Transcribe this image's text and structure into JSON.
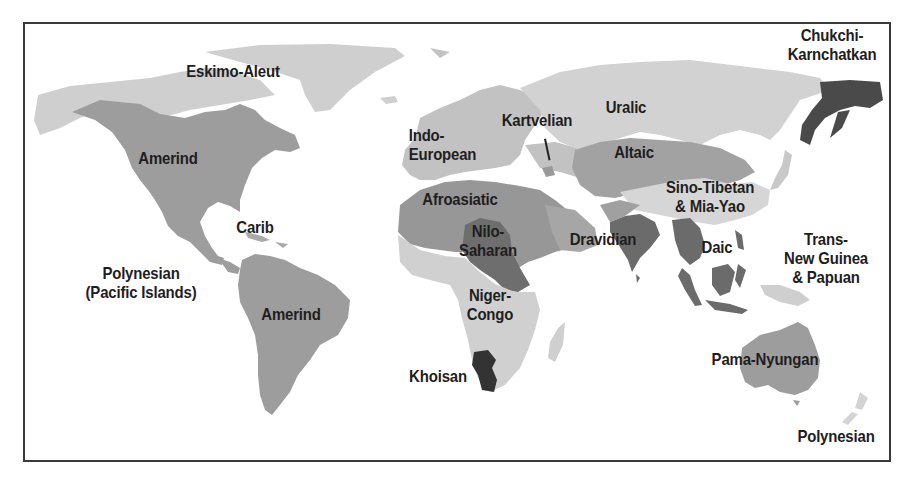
{
  "colors": {
    "very_light": "#d2d2d2",
    "light": "#bdbdbd",
    "medium": "#9d9d9d",
    "medium_dark": "#888888",
    "dark": "#6b6b6b",
    "darkest": "#333333",
    "ocean": "#ffffff",
    "border": "#3a3a3a",
    "label": "#1e1e1e"
  },
  "map": {
    "regions": [
      {
        "name": "Eskimo-Aleut",
        "label": "Eskimo-Aleut",
        "shade": "light"
      },
      {
        "name": "Chukchi-Karnchatkan",
        "label": "Chukchi-\nKarnchatkan",
        "shade": "darkest"
      },
      {
        "name": "Amerind (North America)",
        "label": "Amerind",
        "shade": "medium"
      },
      {
        "name": "Indo-European",
        "label": "Indo-\nEuropean",
        "shade": "light"
      },
      {
        "name": "Kartvelian",
        "label": "Kartvelian",
        "shade": "medium"
      },
      {
        "name": "Uralic",
        "label": "Uralic",
        "shade": "very_light"
      },
      {
        "name": "Altaic",
        "label": "Altaic",
        "shade": "medium"
      },
      {
        "name": "Afroasiatic",
        "label": "Afroasiatic",
        "shade": "medium"
      },
      {
        "name": "Nilo-Saharan",
        "label": "Nilo-\nSaharan",
        "shade": "dark"
      },
      {
        "name": "Dravidian",
        "label": "Dravidian",
        "shade": "dark"
      },
      {
        "name": "Sino-Tibetan & Mia-Yao",
        "label": "Sino-Tibetan\n& Mia-Yao",
        "shade": "very_light"
      },
      {
        "name": "Daic",
        "label": "Daic",
        "shade": "dark"
      },
      {
        "name": "Carib",
        "label": "Carib",
        "shade": "medium"
      },
      {
        "name": "Polynesian (Pacific Islands)",
        "label": "Polynesian\n(Pacific Islands)",
        "shade": "very_light"
      },
      {
        "name": "Amerind (South America)",
        "label": "Amerind",
        "shade": "medium"
      },
      {
        "name": "Niger-Congo",
        "label": "Niger-\nCongo",
        "shade": "very_light"
      },
      {
        "name": "Khoisan",
        "label": "Khoisan",
        "shade": "darkest"
      },
      {
        "name": "Trans-New Guinea & Papuan",
        "label": "Trans-\nNew Guinea\n& Papuan",
        "shade": "very_light"
      },
      {
        "name": "Pama-Nyungan",
        "label": "Pama-Nyungan",
        "shade": "medium"
      },
      {
        "name": "Polynesian",
        "label": "Polynesian",
        "shade": "very_light"
      }
    ]
  }
}
